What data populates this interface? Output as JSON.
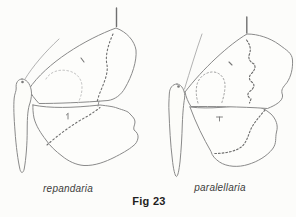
{
  "figure": {
    "caption": "Fig 23",
    "specimens": [
      {
        "label": "repandaria",
        "drawing": "moth-wing-diagram-left"
      },
      {
        "label": "paralellaria",
        "drawing": "moth-wing-diagram-right"
      }
    ]
  },
  "colors": {
    "background": "#fcfcfa",
    "outline_ink": "#8a8a8a",
    "dotted_line_ink": "#6e6e6e",
    "faint_line_ink": "#bcbcbc",
    "label_text": "#3c3c3c",
    "caption_text": "#1f1f1f"
  }
}
